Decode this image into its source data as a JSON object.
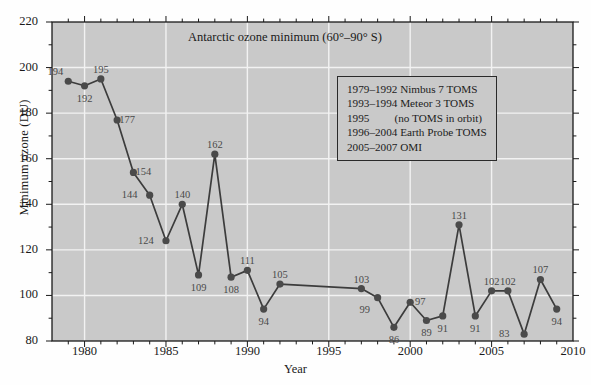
{
  "chart_data": {
    "type": "line",
    "title": "Antarctic ozone minimum (60°–90° S)",
    "xlabel": "Year",
    "ylabel": "Minimum ozone (DU)",
    "xlim": [
      1978,
      2010
    ],
    "ylim": [
      80,
      220
    ],
    "ytick_values": [
      80,
      100,
      120,
      140,
      160,
      180,
      200,
      220
    ],
    "ytick_labels": [
      "80",
      "100",
      "120",
      "140",
      "160",
      "180",
      "200",
      "220"
    ],
    "ytick_minor_step": 10,
    "xtick_values": [
      1980,
      1985,
      1990,
      1995,
      2000,
      2005,
      2010
    ],
    "xtick_labels": [
      "1980",
      "1985",
      "1990",
      "1995",
      "2000",
      "2005",
      "2010"
    ],
    "xtick_minor_step": 1,
    "grid": "major gridlines, white, on gray panel",
    "legend_position": "none",
    "marker": "filled circle",
    "line_color": "#3c3c3c",
    "marker_color": "#4a4a4a",
    "panel_color": "#c9c9c9",
    "gridline_color": "#f2f2f2",
    "x": [
      1979,
      1980,
      1981,
      1982,
      1983,
      1984,
      1985,
      1986,
      1987,
      1988,
      1989,
      1990,
      1991,
      1992,
      1997,
      1998,
      1999,
      2000,
      2001,
      2002,
      2003,
      2004,
      2005,
      2006,
      2007,
      2008,
      2009
    ],
    "values": [
      194,
      192,
      195,
      177,
      154,
      144,
      124,
      140,
      109,
      162,
      108,
      111,
      94,
      105,
      103,
      99,
      86,
      97,
      89,
      91,
      131,
      91,
      102,
      102,
      83,
      107,
      94
    ],
    "point_labels": [
      {
        "year": 1979,
        "value": 194,
        "text": "194",
        "pos": "above-left"
      },
      {
        "year": 1980,
        "value": 192,
        "text": "192",
        "pos": "below"
      },
      {
        "year": 1981,
        "value": 195,
        "text": "195",
        "pos": "above"
      },
      {
        "year": 1982,
        "value": 177,
        "text": "177",
        "pos": "right"
      },
      {
        "year": 1983,
        "value": 154,
        "text": "154",
        "pos": "right"
      },
      {
        "year": 1984,
        "value": 144,
        "text": "144",
        "pos": "left"
      },
      {
        "year": 1985,
        "value": 124,
        "text": "124",
        "pos": "left"
      },
      {
        "year": 1986,
        "value": 140,
        "text": "140",
        "pos": "above"
      },
      {
        "year": 1987,
        "value": 109,
        "text": "109",
        "pos": "below"
      },
      {
        "year": 1988,
        "value": 162,
        "text": "162",
        "pos": "above"
      },
      {
        "year": 1989,
        "value": 108,
        "text": "108",
        "pos": "below"
      },
      {
        "year": 1990,
        "value": 111,
        "text": "111",
        "pos": "above"
      },
      {
        "year": 1991,
        "value": 94,
        "text": "94",
        "pos": "below"
      },
      {
        "year": 1992,
        "value": 105,
        "text": "105",
        "pos": "above"
      },
      {
        "year": 1997,
        "value": 103,
        "text": "103",
        "pos": "above"
      },
      {
        "year": 1998,
        "value": 99,
        "text": "99",
        "pos": "below-left"
      },
      {
        "year": 1999,
        "value": 86,
        "text": "86",
        "pos": "below"
      },
      {
        "year": 2000,
        "value": 97,
        "text": "97",
        "pos": "right"
      },
      {
        "year": 2001,
        "value": 89,
        "text": "89",
        "pos": "below"
      },
      {
        "year": 2002,
        "value": 91,
        "text": "91",
        "pos": "below"
      },
      {
        "year": 2003,
        "value": 131,
        "text": "131",
        "pos": "above"
      },
      {
        "year": 2004,
        "value": 91,
        "text": "91",
        "pos": "below"
      },
      {
        "year": 2005,
        "value": 102,
        "text": "102",
        "pos": "above"
      },
      {
        "year": 2006,
        "value": 102,
        "text": "102",
        "pos": "above"
      },
      {
        "year": 2007,
        "value": 83,
        "text": "83",
        "pos": "left"
      },
      {
        "year": 2008,
        "value": 107,
        "text": "107",
        "pos": "above"
      },
      {
        "year": 2009,
        "value": 94,
        "text": "94",
        "pos": "below"
      }
    ],
    "annotations": {
      "instrument_legend": [
        "1979–1992 Nimbus 7 TOMS",
        "1993–1994 Meteor 3 TOMS",
        "1995   (no TOMS in orbit)",
        "1996–2004 Earth Probe TOMS",
        "2005–2007 OMI"
      ]
    }
  }
}
